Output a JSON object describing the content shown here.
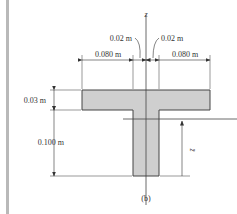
{
  "figure": {
    "caption": "(b)",
    "axis_label": "z",
    "centroid_label": "z̄",
    "dimensions": {
      "flange_left_width": "0.080 m",
      "flange_right_width": "0.080 m",
      "web_half_left": "0.02 m",
      "web_half_right": "0.02 m",
      "flange_thickness": "0.03 m",
      "web_height": "0.100 m"
    },
    "colors": {
      "section_fill": "#cfcfcf",
      "outline": "#444444",
      "sidebar": "#b9b9b9"
    }
  }
}
